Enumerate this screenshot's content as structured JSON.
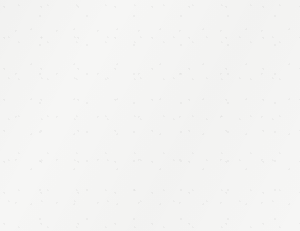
{
  "chart_data": {
    "type": "bar",
    "title": "2010 ENROLLMENT AT FIVE COLLEGES",
    "xlabel": "",
    "ylabel": "Enrollment",
    "categories": [
      "College A",
      "College B",
      "College C",
      "College D",
      "College E"
    ],
    "values": [
      3000,
      3500,
      4000,
      6500,
      8000
    ],
    "ylim": [
      0,
      9000
    ],
    "ytick_step": 1000,
    "yticks": [
      0,
      1000,
      2000,
      3000,
      4000,
      5000,
      6000,
      7000,
      8000,
      9000
    ],
    "ytick_labels": [
      "0",
      "1000",
      "2000",
      "3000",
      "4000",
      "5000",
      "6000",
      "7000",
      "8000",
      "9000"
    ],
    "grid": true,
    "grid_axis": "y",
    "legend": false,
    "minor_ticks": true,
    "bar_color": "#b2b2b2",
    "bar_edge_color": "#5e5e5e",
    "grid_color": "#a9a9a9",
    "axis_color": "#707070",
    "background_color": "#f6f6f5"
  }
}
